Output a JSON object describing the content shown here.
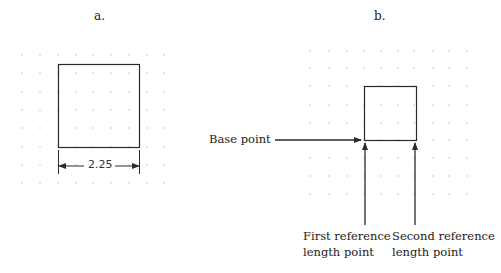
{
  "panels": [
    {
      "label": "a.",
      "dimension_value": "2.25"
    },
    {
      "label": "b.",
      "annotations": {
        "base_point": "Base point",
        "first_reference_line1": "First reference",
        "first_reference_line2": "length point",
        "second_reference_line1": "Second reference",
        "second_reference_line2": "length point"
      }
    }
  ],
  "colors": {
    "line": "#2a2a2a",
    "grid_dot": "#b5b5b5"
  }
}
